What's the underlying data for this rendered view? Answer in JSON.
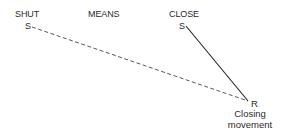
{
  "diagram": {
    "type": "concept-relation",
    "headings": {
      "left": "SHUT",
      "middle": "MEANS",
      "right": "CLOSE"
    },
    "nodes": {
      "shut_symbol": "S",
      "close_symbol": "S",
      "referent_symbol": "R",
      "referent_caption_line1": "Closing",
      "referent_caption_line2": "movement"
    },
    "edges": [
      {
        "from": "SHUT S",
        "to": "R",
        "style": "dashed"
      },
      {
        "from": "CLOSE S",
        "to": "R",
        "style": "solid"
      }
    ],
    "colors": {
      "text": "#2a2a2a",
      "line": "#333333",
      "background": "#ffffff"
    }
  }
}
